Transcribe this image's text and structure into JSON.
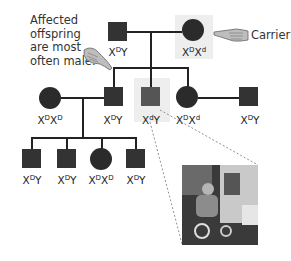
{
  "annotations": {
    "affected_note": [
      "Affected",
      "offspring",
      "are most",
      "often male."
    ],
    "carrier_note": "Carrier"
  },
  "generation1": [
    {
      "sex": "male",
      "genotype": {
        "base1": "X",
        "sup1": "D",
        "base2": "Y",
        "sup2": ""
      }
    },
    {
      "sex": "female",
      "genotype": {
        "base1": "X",
        "sup1": "D",
        "base2": "X",
        "sup2": "d"
      },
      "role": "carrier"
    }
  ],
  "generation2": [
    {
      "sex": "female",
      "genotype": {
        "base1": "X",
        "sup1": "D",
        "base2": "X",
        "sup2": "D"
      },
      "role": "spouse"
    },
    {
      "sex": "male",
      "genotype": {
        "base1": "X",
        "sup1": "D",
        "base2": "Y",
        "sup2": ""
      }
    },
    {
      "sex": "male",
      "genotype": {
        "base1": "X",
        "sup1": "d",
        "base2": "Y",
        "sup2": ""
      },
      "role": "affected"
    },
    {
      "sex": "female",
      "genotype": {
        "base1": "X",
        "sup1": "D",
        "base2": "X",
        "sup2": "d"
      }
    },
    {
      "sex": "male",
      "genotype": {
        "base1": "X",
        "sup1": "D",
        "base2": "Y",
        "sup2": ""
      },
      "role": "spouse"
    }
  ],
  "generation3": [
    {
      "sex": "male",
      "genotype": {
        "base1": "X",
        "sup1": "D",
        "base2": "Y",
        "sup2": ""
      }
    },
    {
      "sex": "male",
      "genotype": {
        "base1": "X",
        "sup1": "D",
        "base2": "Y",
        "sup2": ""
      }
    },
    {
      "sex": "female",
      "genotype": {
        "base1": "X",
        "sup1": "D",
        "base2": "X",
        "sup2": "D"
      }
    },
    {
      "sex": "male",
      "genotype": {
        "base1": "X",
        "sup1": "D",
        "base2": "Y",
        "sup2": ""
      }
    }
  ],
  "photo": {
    "description": "person in wheelchair using ATM"
  }
}
